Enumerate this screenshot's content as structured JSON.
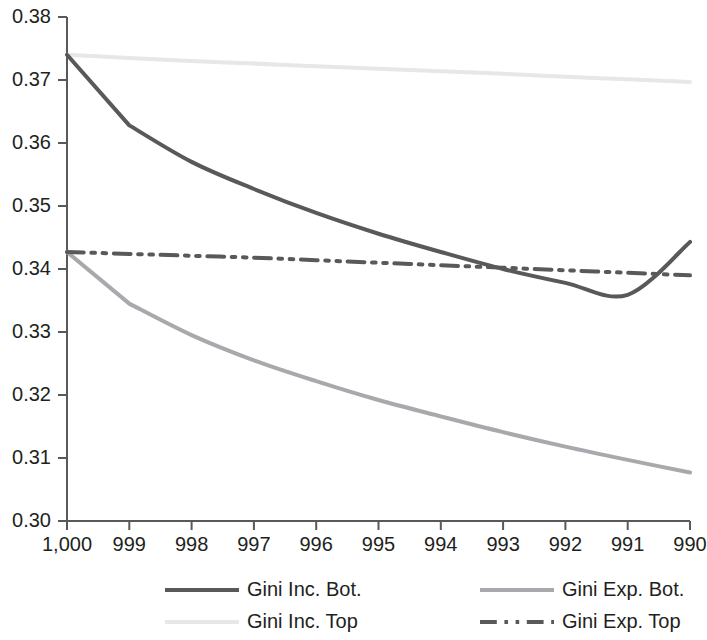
{
  "chart_data": {
    "type": "line",
    "title": "",
    "subtitle": "",
    "xlabel": "",
    "ylabel": "",
    "x": [
      1000,
      999,
      998,
      997,
      996,
      995,
      994,
      993,
      992,
      991,
      990
    ],
    "x_tick_labels": [
      "1,000",
      "999",
      "998",
      "997",
      "996",
      "995",
      "994",
      "993",
      "992",
      "991",
      "990"
    ],
    "y_tick_labels": [
      "0.38",
      "0.37",
      "0.36",
      "0.35",
      "0.34",
      "0.33",
      "0.32",
      "0.31",
      "0.30"
    ],
    "y_ticks": [
      0.38,
      0.37,
      0.36,
      0.35,
      0.34,
      0.33,
      0.32,
      0.31,
      0.3
    ],
    "xlim": [
      1000,
      990
    ],
    "ylim": [
      0.3,
      0.38
    ],
    "grid": false,
    "legend_position": "bottom",
    "x_axis_reversed": true,
    "series": [
      {
        "name": "Gini Inc. Bot.",
        "color": "#58595b",
        "style": "solid",
        "width": 4,
        "values": [
          0.374,
          0.3628,
          0.357,
          0.3527,
          0.3489,
          0.3456,
          0.3427,
          0.34,
          0.3378,
          0.3359,
          0.3443
        ]
      },
      {
        "name": "Gini Exp. Bot.",
        "color": "#a7a9ac",
        "style": "solid",
        "width": 4,
        "values": [
          0.3427,
          0.3345,
          0.3295,
          0.3255,
          0.3222,
          0.3192,
          0.3166,
          0.3141,
          0.3118,
          0.3097,
          0.3077
        ]
      },
      {
        "name": "Gini Inc. Top",
        "color": "#e6e7e8",
        "style": "solid",
        "width": 4,
        "values": [
          0.374,
          0.3735,
          0.373,
          0.3726,
          0.3722,
          0.3718,
          0.3714,
          0.371,
          0.3705,
          0.3701,
          0.3697
        ]
      },
      {
        "name": "Gini Exp. Top",
        "color": "#58595b",
        "style": "dashdot",
        "width": 4,
        "values": [
          0.3427,
          0.3424,
          0.3421,
          0.3418,
          0.3414,
          0.341,
          0.3406,
          0.3402,
          0.3398,
          0.3394,
          0.339
        ]
      }
    ],
    "legend": [
      {
        "label": "Gini Inc. Bot.",
        "color": "#58595b",
        "style": "solid"
      },
      {
        "label": "Gini Exp. Bot.",
        "color": "#a7a9ac",
        "style": "solid"
      },
      {
        "label": "Gini Inc. Top",
        "color": "#e6e7e8",
        "style": "solid"
      },
      {
        "label": "Gini Exp. Top",
        "color": "#58595b",
        "style": "dashdot"
      }
    ]
  }
}
